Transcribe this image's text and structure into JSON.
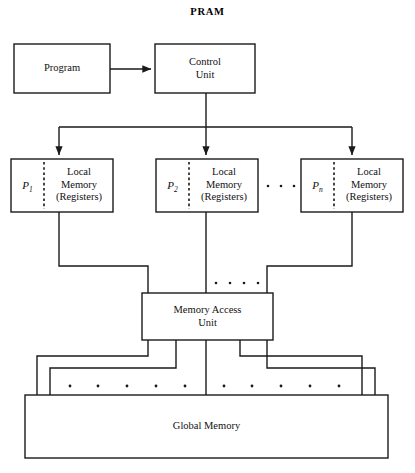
{
  "title": "PRAM",
  "nodes": {
    "program": {
      "label": "Program"
    },
    "control_unit": {
      "label": "Control\nUnit"
    },
    "memory_access_unit": {
      "label": "Memory Access\nUnit"
    },
    "global_memory": {
      "label": "Global Memory"
    }
  },
  "processors": [
    {
      "proc": "P",
      "index": "1",
      "memory": "Local\nMemory\n(Registers)"
    },
    {
      "proc": "P",
      "index": "2",
      "memory": "Local\nMemory\n(Registers)"
    },
    {
      "proc": "P",
      "index": "n",
      "memory": "Local\nMemory\n(Registers)"
    }
  ],
  "ellipses": {
    "between_processors": "• • •",
    "above_memory_access_unit": "• • • •",
    "above_global_memory": "• • • • •  • • • • •"
  },
  "colors": {
    "line": "#1a1a1a",
    "background": "#ffffff",
    "text": "#111111"
  }
}
